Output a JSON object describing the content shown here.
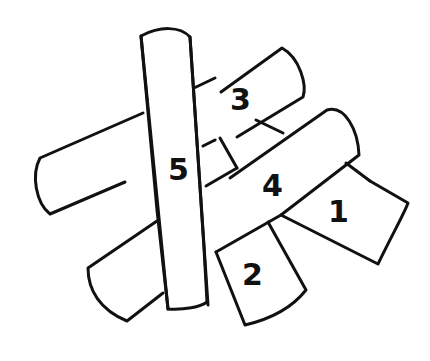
{
  "diagram": {
    "type": "overlapping-sticks-puzzle",
    "stroke_color": "#111111",
    "background": "#ffffff",
    "pieces": [
      {
        "id": "1",
        "label": "1"
      },
      {
        "id": "2",
        "label": "2"
      },
      {
        "id": "3",
        "label": "3"
      },
      {
        "id": "4",
        "label": "4"
      },
      {
        "id": "5",
        "label": "5"
      }
    ],
    "stacking_order_top_to_bottom": [
      "5",
      "4",
      "3",
      "2",
      "1"
    ]
  }
}
